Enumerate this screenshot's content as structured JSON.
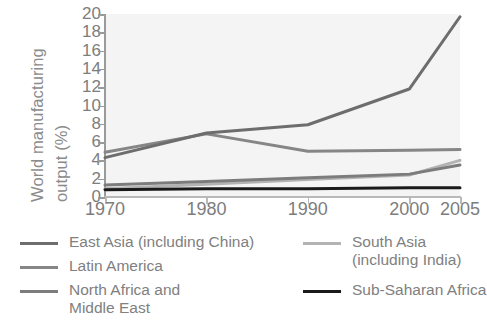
{
  "chart_data": {
    "type": "line",
    "title": "",
    "xlabel": "",
    "ylabel": "World manufacturing output (%)",
    "ylabel_line1": "World manufacturing",
    "ylabel_line2": "output (%)",
    "categories": [
      "1970",
      "1980",
      "1990",
      "2000",
      "2005"
    ],
    "x": [
      1970,
      1980,
      1990,
      2000,
      2005
    ],
    "xlim": [
      1970,
      2005
    ],
    "ylim": [
      0,
      20
    ],
    "yticks": [
      0,
      2,
      4,
      6,
      8,
      10,
      12,
      14,
      16,
      18,
      20
    ],
    "ytick_labels": [
      "0",
      "2",
      "4",
      "6",
      "8",
      "10",
      "12",
      "14",
      "16",
      "18",
      "20"
    ],
    "xticks": [
      1970,
      1980,
      1990,
      2000,
      2005
    ],
    "xtick_labels": [
      "1970",
      "1980",
      "1990",
      "2000",
      "2005"
    ],
    "grid": false,
    "legend_position": "below",
    "series": [
      {
        "name": "East Asia (including China)",
        "legend_label_line1": "East Asia (including China)",
        "legend_label_line2": "",
        "color": "#6d6d6d",
        "width": 3.0,
        "values": [
          4.3,
          7.0,
          7.9,
          11.8,
          19.7
        ]
      },
      {
        "name": "Latin America",
        "legend_label_line1": "Latin America",
        "legend_label_line2": "",
        "color": "#868686",
        "width": 3.0,
        "values": [
          4.9,
          6.9,
          5.0,
          5.1,
          5.2
        ]
      },
      {
        "name": "North Africa and Middle East",
        "legend_label_line1": "North Africa and",
        "legend_label_line2": "Middle East",
        "color": "#7c7c7c",
        "width": 3.0,
        "values": [
          1.3,
          1.7,
          2.1,
          2.5,
          3.5
        ]
      },
      {
        "name": "South Asia (including India)",
        "legend_label_line1": "South Asia",
        "legend_label_line2": "(including India)",
        "color": "#b3b3b3",
        "width": 3.0,
        "values": [
          0.9,
          1.4,
          1.9,
          2.4,
          4.0
        ]
      },
      {
        "name": "Sub-Saharan Africa",
        "legend_label_line1": "Sub-Saharan Africa",
        "legend_label_line2": "",
        "color": "#1a1a1a",
        "width": 3.0,
        "values": [
          0.8,
          0.9,
          0.9,
          1.0,
          1.0
        ]
      }
    ],
    "colors": {
      "plot_background": "#f4f4f4",
      "figure_background": "#ffffff",
      "axis": "#9a9a9a",
      "tick_text": "#7d7d7d",
      "legend_text": "#808080",
      "ylabel_text": "#8b8b8b"
    }
  },
  "legend": {
    "entries": [
      {
        "label_line1": "East Asia (including China)",
        "label_line2": "",
        "color": "#6d6d6d"
      },
      {
        "label_line1": "Latin America",
        "label_line2": "",
        "color": "#868686"
      },
      {
        "label_line1": "North Africa and",
        "label_line2": "Middle East",
        "color": "#7c7c7c"
      },
      {
        "label_line1": "South Asia",
        "label_line2": "(including India)",
        "color": "#b3b3b3"
      },
      {
        "label_line1": "Sub-Saharan Africa",
        "label_line2": "",
        "color": "#1a1a1a"
      }
    ]
  }
}
